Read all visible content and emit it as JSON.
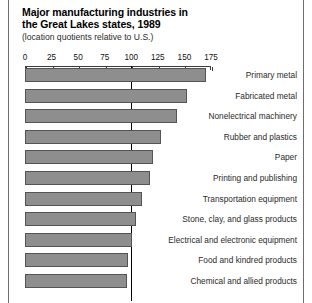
{
  "figure": {
    "title_line1": "Major manufacturing industries in",
    "title_line2": "the Great Lakes states, 1989",
    "subtitle": "(location quotients relative to U.S.)"
  },
  "chart_data": {
    "type": "bar",
    "orientation": "horizontal",
    "title": "Major manufacturing industries in the Great Lakes states, 1989",
    "subtitle": "(location quotients relative to U.S.)",
    "xlabel": "",
    "ylabel": "",
    "xlim": [
      0,
      175
    ],
    "grid": false,
    "legend": "none",
    "reference_line": 100,
    "tick_labels": [
      "0",
      "25",
      "50",
      "75",
      "100",
      "125",
      "150",
      "175"
    ],
    "ticks": [
      0,
      25,
      50,
      75,
      100,
      125,
      150,
      175
    ],
    "categories": [
      "Primary metal",
      "Fabricated metal",
      "Nonelectrical machinery",
      "Rubber and plastics",
      "Paper",
      "Printing and publishing",
      "Transportation equipment",
      "Stone, clay, and glass products",
      "Electrical and electronic equipment",
      "Food and kindred products",
      "Chemical and allied products"
    ],
    "values": [
      170,
      152,
      143,
      128,
      120,
      118,
      110,
      104,
      101,
      97,
      96
    ],
    "bar_color": "#8e8e8e",
    "bar_border_color": "#545454",
    "axis_color": "#3b3b3b",
    "reference_line_color": "#000000"
  }
}
